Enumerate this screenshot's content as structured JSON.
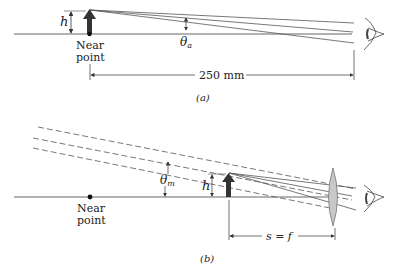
{
  "panel_a": {
    "caption": "(a)",
    "object_height_label": "h",
    "near_point_label_1": "Near",
    "near_point_label_2": "point",
    "angle_label": "θ",
    "angle_sub": "a",
    "distance_label": "250 mm"
  },
  "panel_b": {
    "caption": "(b)",
    "object_height_label": "h",
    "near_point_label_1": "Near",
    "near_point_label_2": "point",
    "angle_label": "θ",
    "angle_sub": "m",
    "distance_label": "s = f"
  },
  "colors": {
    "line": "#555555",
    "arrow": "#333333",
    "lens_fill": "#c8c8c8"
  }
}
